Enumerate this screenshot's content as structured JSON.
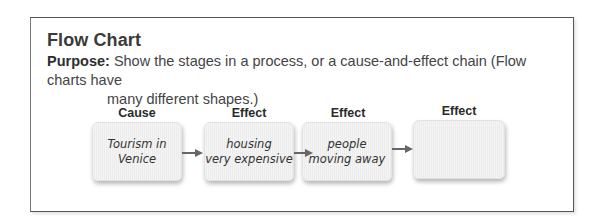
{
  "title": "Flow Chart",
  "purpose": {
    "label": "Purpose:",
    "line1": "Show the stages in a process, or a cause-and-effect chain  (Flow charts have",
    "line2": "many different shapes.)"
  },
  "flow": {
    "stages": [
      {
        "header": "Cause",
        "text": "Tourism in\nVenice"
      },
      {
        "header": "Effect",
        "text": "housing\nvery expensive"
      },
      {
        "header": "Effect",
        "text": "people\nmoving away"
      },
      {
        "header": "Effect",
        "text": ""
      }
    ],
    "arrow_color": "#666666"
  }
}
